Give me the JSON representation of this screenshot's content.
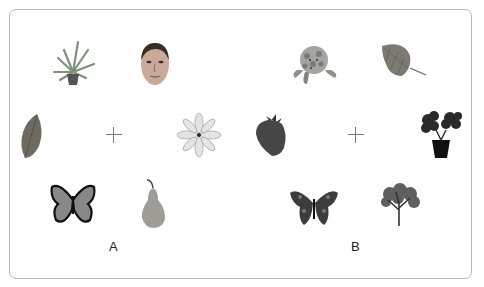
{
  "panels": [
    {
      "label": "A",
      "items": {
        "top_left": "potted-plant",
        "top_right": "human-face",
        "middle_left": "leaf",
        "middle_right": "white-flower",
        "bottom_left": "butterfly",
        "bottom_right": "pear"
      }
    },
    {
      "label": "B",
      "items": {
        "top_left": "flower-cluster",
        "top_right": "leaf",
        "middle_left": "strawberry",
        "middle_right": "potted-plant",
        "bottom_left": "butterfly",
        "bottom_right": "tree"
      }
    }
  ],
  "fixation_symbol": "+"
}
